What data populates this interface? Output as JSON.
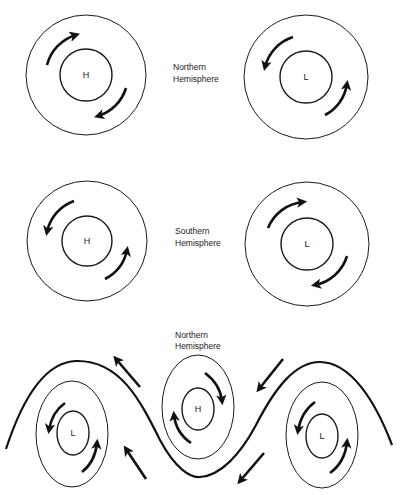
{
  "panels": [
    {
      "id": "northern-pair",
      "label": [
        "Northern",
        "Hemisphere"
      ],
      "systems": [
        {
          "center_label": "H",
          "rotation": "clockwise"
        },
        {
          "center_label": "L",
          "rotation": "counterclockwise"
        }
      ]
    },
    {
      "id": "southern-pair",
      "label": [
        "Southern",
        "Hemisphere"
      ],
      "systems": [
        {
          "center_label": "H",
          "rotation": "counterclockwise"
        },
        {
          "center_label": "L",
          "rotation": "clockwise"
        }
      ]
    },
    {
      "id": "northern-wave",
      "label": [
        "Northern",
        "Hemisphere"
      ],
      "systems": [
        {
          "center_label": "L",
          "rotation": "counterclockwise"
        },
        {
          "center_label": "H",
          "rotation": "clockwise"
        },
        {
          "center_label": "L",
          "rotation": "counterclockwise"
        }
      ]
    }
  ],
  "colors": {
    "ink": "#111111",
    "background": "#ffffff"
  }
}
